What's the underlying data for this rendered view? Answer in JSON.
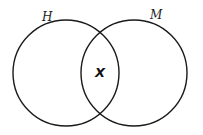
{
  "diagram": {
    "type": "venn",
    "sets": [
      {
        "label": "H",
        "cx": 66,
        "cy": 73,
        "r": 53
      },
      {
        "label": "M",
        "cx": 134,
        "cy": 73,
        "r": 53
      }
    ],
    "intersection_label": "X",
    "stroke_color": "#1a1a1a",
    "background": "#ffffff"
  }
}
